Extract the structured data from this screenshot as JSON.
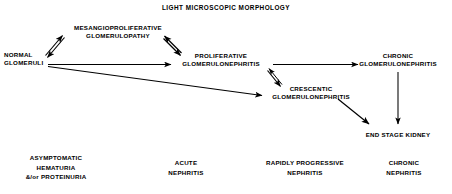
{
  "diagram": {
    "title": "LIGHT MICROSCOPIC MORPHOLOGY",
    "background_color": "#ffffff",
    "ink_color": "#000000"
  },
  "nodes": [
    {
      "id": "normal-glomeruli",
      "lines": [
        "NORMAL",
        "GLOMERULI"
      ],
      "line1": "NORMAL",
      "line2": "GLOMERULI",
      "x": 4,
      "y": 51,
      "align": "left"
    },
    {
      "id": "mesangioproliferative-glomerulopathy",
      "lines": [
        "MESANGIOPROLIFERATIVE",
        "GLOMERULOPATHY"
      ],
      "line1": "MESANGIOPROLIFERATIVE",
      "line2": "GLOMERULOPATHY",
      "x": 118,
      "y": 24,
      "align": "center"
    },
    {
      "id": "proliferative-glomerulonephritis",
      "lines": [
        "PROLIFERATIVE",
        "GLOMERULONEPHRITIS"
      ],
      "line1": "PROLIFERATIVE",
      "line2": "GLOMERULONEPHRITIS",
      "x": 221,
      "y": 52,
      "align": "center"
    },
    {
      "id": "crescentic-glomerulonephritis",
      "lines": [
        "CRESCENTIC",
        "GLOMERULONEPHRITIS"
      ],
      "line1": "CRESCENTIC",
      "line2": "GLOMERULONEPHRITIS",
      "x": 311,
      "y": 85,
      "align": "center"
    },
    {
      "id": "chronic-glomerulonephritis",
      "lines": [
        "CHRONIC",
        "GLOMERULONEPHRITIS"
      ],
      "line1": "CHRONIC",
      "line2": "GLOMERULONEPHRITIS",
      "x": 398,
      "y": 52,
      "align": "center"
    },
    {
      "id": "end-stage-kidney",
      "lines": [
        "END STAGE KIDNEY"
      ],
      "line1": "END STAGE KIDNEY",
      "line2": "",
      "x": 398,
      "y": 131,
      "align": "center"
    }
  ],
  "clinical_labels": [
    {
      "id": "asymptomatic-hematuria-proteinuria",
      "line1": "ASYMPTOMATIC",
      "line2": "HEMATURIA",
      "line3": "&/or PROTEINURIA",
      "x": 56,
      "y": 153
    },
    {
      "id": "acute-nephritis",
      "line1": "ACUTE",
      "line2": "NEPHRITIS",
      "line3": "",
      "x": 186,
      "y": 158
    },
    {
      "id": "rapidly-progressive-nephritis",
      "line1": "RAPIDLY PROGRESSIVE",
      "line2": "NEPHRITIS",
      "line3": "",
      "x": 305,
      "y": 158
    },
    {
      "id": "chronic-nephritis",
      "line1": "CHRONIC",
      "line2": "NEPHRITIS",
      "line3": "",
      "x": 404,
      "y": 158
    }
  ],
  "edges": [
    {
      "id": "normal-to-mesangioproliferative",
      "from": "normal-glomeruli",
      "to": "mesangioproliferative-glomerulopathy",
      "style": "arrow"
    },
    {
      "id": "mesangioproliferative-to-normal",
      "from": "mesangioproliferative-glomerulopathy",
      "to": "normal-glomeruli",
      "style": "arrow"
    },
    {
      "id": "mesangioproliferative-to-proliferative",
      "from": "mesangioproliferative-glomerulopathy",
      "to": "proliferative-glomerulonephritis",
      "style": "arrow"
    },
    {
      "id": "proliferative-to-mesangioproliferative",
      "from": "proliferative-glomerulonephritis",
      "to": "mesangioproliferative-glomerulopathy",
      "style": "arrow"
    },
    {
      "id": "normal-to-proliferative",
      "from": "normal-glomeruli",
      "to": "proliferative-glomerulonephritis",
      "style": "arrow"
    },
    {
      "id": "normal-to-crescentic",
      "from": "normal-glomeruli",
      "to": "crescentic-glomerulonephritis",
      "style": "arrow"
    },
    {
      "id": "proliferative-to-crescentic",
      "from": "proliferative-glomerulonephritis",
      "to": "crescentic-glomerulonephritis",
      "style": "arrow"
    },
    {
      "id": "crescentic-to-proliferative",
      "from": "crescentic-glomerulonephritis",
      "to": "proliferative-glomerulonephritis",
      "style": "arrow"
    },
    {
      "id": "proliferative-to-chronic",
      "from": "proliferative-glomerulonephritis",
      "to": "chronic-glomerulonephritis",
      "style": "arrow"
    },
    {
      "id": "crescentic-to-end-stage",
      "from": "crescentic-glomerulonephritis",
      "to": "end-stage-kidney",
      "style": "arrow"
    },
    {
      "id": "chronic-to-end-stage",
      "from": "chronic-glomerulonephritis",
      "to": "end-stage-kidney",
      "style": "arrow"
    }
  ]
}
